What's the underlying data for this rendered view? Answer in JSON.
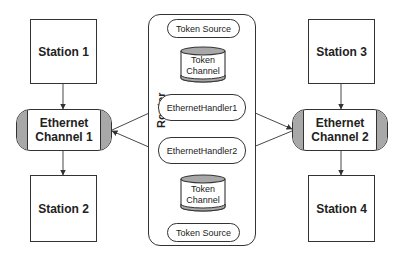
{
  "diagram": {
    "stations": [
      {
        "id": "station1",
        "label": "Station 1"
      },
      {
        "id": "station2",
        "label": "Station 2"
      },
      {
        "id": "station3",
        "label": "Station 3"
      },
      {
        "id": "station4",
        "label": "Station 4"
      }
    ],
    "channels": [
      {
        "id": "channel1",
        "line1": "Ethernet",
        "line2": "Channel 1"
      },
      {
        "id": "channel2",
        "line1": "Ethernet",
        "line2": "Channel 2"
      }
    ],
    "router": {
      "label": "Router",
      "token_source_top": "Token Source",
      "token_channel_top": {
        "line1": "Token",
        "line2": "Channel"
      },
      "handler1": "EthernetHandler1",
      "handler2": "EthernetHandler2",
      "token_channel_bottom": {
        "line1": "Token",
        "line2": "Channel"
      },
      "token_source_bottom": "Token Source"
    },
    "colors": {
      "stroke": "#333333",
      "cap_fill": "#a8a8a8",
      "background": "#ffffff"
    }
  }
}
